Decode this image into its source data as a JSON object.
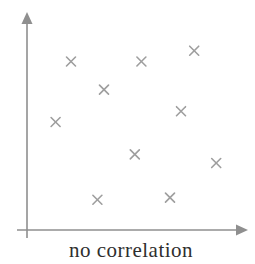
{
  "chart_data": {
    "type": "scatter",
    "title": "no correlation",
    "xlabel": "",
    "ylabel": "",
    "xlim": [
      0,
      10
    ],
    "ylim": [
      0,
      10
    ],
    "grid": false,
    "legend": null,
    "marker": "x",
    "series": [
      {
        "name": "points",
        "points": [
          {
            "x": 2.0,
            "y": 7.8
          },
          {
            "x": 5.2,
            "y": 7.8
          },
          {
            "x": 7.6,
            "y": 8.3
          },
          {
            "x": 3.5,
            "y": 6.5
          },
          {
            "x": 7.0,
            "y": 5.5
          },
          {
            "x": 1.3,
            "y": 5.0
          },
          {
            "x": 4.9,
            "y": 3.5
          },
          {
            "x": 8.6,
            "y": 3.1
          },
          {
            "x": 3.2,
            "y": 1.4
          },
          {
            "x": 6.5,
            "y": 1.5
          }
        ]
      }
    ]
  },
  "colors": {
    "axis": "#8f8f8f",
    "marker": "#9e9e9e",
    "caption_text": "#2e2e2e"
  }
}
